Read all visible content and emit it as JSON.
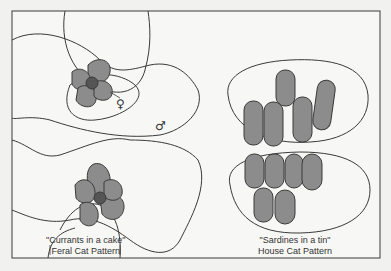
{
  "diagram": {
    "panels": [
      {
        "id": "feral",
        "caption_line1": "\"Currants in a cake\"",
        "caption_line2": "Feral Cat Pattern",
        "symbols": {
          "female": "♀",
          "male": "♂"
        }
      },
      {
        "id": "house",
        "caption_line1": "\"Sardines in a tin\"",
        "caption_line2": "House Cat Pattern"
      }
    ],
    "colors": {
      "background": "#f1f1ef",
      "line": "#3a3a3a",
      "territory_fill": "#8c8c8c",
      "core_fill": "#555555"
    }
  }
}
